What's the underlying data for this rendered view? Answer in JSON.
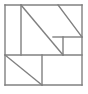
{
  "figure": {
    "type": "line-drawing",
    "canvas": {
      "width": 88,
      "height": 94
    },
    "style": {
      "stroke_color": "#808080",
      "stroke_width": 1.4,
      "fill_color": "#ffffff",
      "background": "#ffffff"
    },
    "outer_square": {
      "x": 5,
      "y": 5,
      "width": 77,
      "height": 80
    },
    "segments": [
      {
        "name": "outer-top-edge",
        "x1": 5,
        "y1": 5,
        "x2": 82,
        "y2": 5
      },
      {
        "name": "outer-right-edge",
        "x1": 82,
        "y1": 5,
        "x2": 82,
        "y2": 85
      },
      {
        "name": "outer-bottom-edge",
        "x1": 82,
        "y1": 85,
        "x2": 5,
        "y2": 85
      },
      {
        "name": "outer-left-edge",
        "x1": 5,
        "y1": 85,
        "x2": 5,
        "y2": 5
      },
      {
        "name": "upper-left-vertical-divider",
        "x1": 21,
        "y1": 5,
        "x2": 21,
        "y2": 55
      },
      {
        "name": "mid-horizontal-divider",
        "x1": 5,
        "y1": 55,
        "x2": 82,
        "y2": 55
      },
      {
        "name": "right-inner-horizontal-divider",
        "x1": 53,
        "y1": 37,
        "x2": 82,
        "y2": 37
      },
      {
        "name": "right-inner-vertical-divider",
        "x1": 63,
        "y1": 37,
        "x2": 63,
        "y2": 55
      },
      {
        "name": "lower-vertical-divider",
        "x1": 42,
        "y1": 55,
        "x2": 42,
        "y2": 85
      },
      {
        "name": "main-diagonal",
        "x1": 21,
        "y1": 5,
        "x2": 63,
        "y2": 55
      },
      {
        "name": "upper-right-diagonal",
        "x1": 58,
        "y1": 5,
        "x2": 82,
        "y2": 37
      },
      {
        "name": "lower-left-diagonal",
        "x1": 5,
        "y1": 55,
        "x2": 42,
        "y2": 85
      }
    ]
  }
}
